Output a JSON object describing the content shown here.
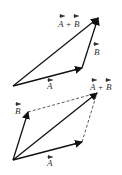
{
  "diagram": {
    "top": {
      "method": "triangle",
      "labels": {
        "sum": "A + B",
        "b": "B",
        "a": "A"
      }
    },
    "bottom": {
      "method": "parallelogram",
      "labels": {
        "sum": "A + B",
        "b": "B",
        "a": "A"
      }
    },
    "colors": {
      "stroke": "#111111",
      "label": "#333333"
    }
  }
}
